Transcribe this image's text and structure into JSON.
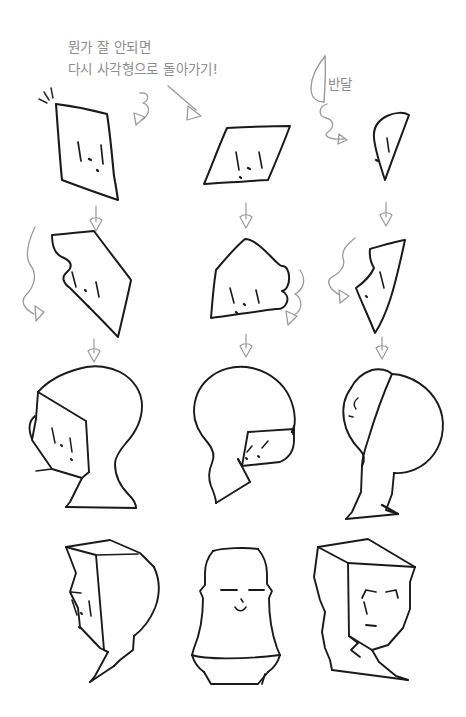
{
  "page": {
    "kind": "hand-drawn-sketch-tutorial",
    "background_color": "#ffffff",
    "ink_color": "#1a1a1a",
    "pencil_color": "#8d8d8d",
    "width": 466,
    "height": 717
  },
  "annotations": {
    "note_line_1": "뭔가 잘 안되면",
    "note_line_2": "다시 사각형으로 돌아가기!",
    "half_moon_label": "반달"
  },
  "grid": {
    "rows": 4,
    "columns": 3,
    "row_labels": [
      "base-shapes",
      "nose-added-shapes",
      "full-head-constructions",
      "final-heads"
    ]
  },
  "cells": [
    {
      "row": 1,
      "col": 1,
      "name": "quad-face-left",
      "description": "rough quadrilateral face block tilted left with two eye dashes, nose dot and mouth tick"
    },
    {
      "row": 1,
      "col": 2,
      "name": "quad-face-right",
      "description": "rough parallelogram face block tilted right with eye dashes and nose dot"
    },
    {
      "row": 1,
      "col": 3,
      "name": "half-moon-face",
      "description": "half moon / leaf shaped face block with single eye dash"
    },
    {
      "row": 2,
      "col": 1,
      "name": "quad-face-left-nose",
      "description": "quad face with nose bump bulging on the left edge"
    },
    {
      "row": 2,
      "col": 2,
      "name": "quad-face-right-nose",
      "description": "quad face with nose bump bulging on the right edge"
    },
    {
      "row": 2,
      "col": 3,
      "name": "half-moon-face-nose",
      "description": "half moon face with angular nose notch on the left edge"
    },
    {
      "row": 3,
      "col": 1,
      "name": "head-profile-left",
      "description": "left facing head profile with face block inset, cranium and neck"
    },
    {
      "row": 3,
      "col": 2,
      "name": "head-profile-right",
      "description": "right facing head profile with face block inset, cranium and neck"
    },
    {
      "row": 3,
      "col": 3,
      "name": "head-profile-halfmoon",
      "description": "head profile built from the half moon face block"
    },
    {
      "row": 4,
      "col": 1,
      "name": "final-head-left",
      "description": "finished angular head facing left with eyes, nose and neck"
    },
    {
      "row": 4,
      "col": 2,
      "name": "final-head-front",
      "description": "finished front facing head with closed eyes and small smile"
    },
    {
      "row": 4,
      "col": 3,
      "name": "final-head-three-quarter",
      "description": "finished three quarter view head with angled brows and mouth"
    }
  ],
  "arrows": [
    {
      "name": "arrow-note-to-quad",
      "style": "diagonal-outline",
      "from": "note-text",
      "to": "quad-face-right"
    },
    {
      "name": "arrow-curl-row1-col1",
      "style": "curly-outline"
    },
    {
      "name": "arrow-curl-bandal",
      "style": "curly-outline"
    },
    {
      "name": "arrow-down-r1c1",
      "style": "straight-down-outline"
    },
    {
      "name": "arrow-down-r1c2",
      "style": "straight-down-outline"
    },
    {
      "name": "arrow-down-r1c3",
      "style": "straight-down-outline"
    },
    {
      "name": "arrow-down-r2c1",
      "style": "straight-down-outline"
    },
    {
      "name": "arrow-down-r2c2",
      "style": "straight-down-outline"
    },
    {
      "name": "arrow-down-r2c3",
      "style": "straight-down-outline"
    },
    {
      "name": "arrow-squiggle-r2c1",
      "style": "wavy-outline"
    },
    {
      "name": "arrow-squiggle-r2c2",
      "style": "wavy-outline"
    },
    {
      "name": "arrow-squiggle-r2c3",
      "style": "wavy-outline"
    }
  ]
}
